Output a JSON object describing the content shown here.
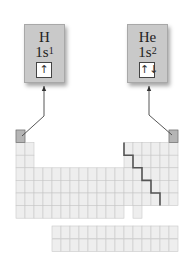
{
  "figure": {
    "elements": [
      {
        "symbol": "H",
        "config_base": "1s",
        "config_exp": "1",
        "orbital": "↑",
        "group": 1,
        "period": 1
      },
      {
        "symbol": "He",
        "config_base": "1s",
        "config_exp": "2",
        "orbital": "↑↓",
        "group": 18,
        "period": 1
      }
    ],
    "colors": {
      "box_fill": "#c9c9c9",
      "table_cell": "#eeeeee",
      "grid_line": "#c8c8c8",
      "highlight_cell": "#b5b5b5",
      "staircase_line": "#555555"
    }
  }
}
